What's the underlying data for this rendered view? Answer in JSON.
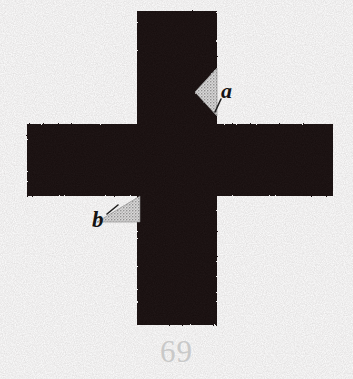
{
  "figure": {
    "number": "69",
    "kind": "cross-dissection-diagram",
    "background_color": "#ffffff",
    "body_color": "#141010",
    "shading_color": "#c6c6c6",
    "label_color": "#141414",
    "number_color": "#c9c9c9",
    "labels": [
      {
        "id": "a",
        "text": "a",
        "points_to": "triangular-notch-upper-right-of-vertical-arm"
      },
      {
        "id": "b",
        "text": "b",
        "points_to": "triangular-piece-below-left-horizontal-arm"
      }
    ],
    "shapes": {
      "cross": {
        "name": "greek-cross",
        "vertical_arm": {
          "left": 137,
          "right": 217,
          "top": 11,
          "bottom": 325
        },
        "horizontal_arm": {
          "left": 27,
          "right": 333,
          "top": 124,
          "bottom": 196
        }
      },
      "triangle_a": {
        "name": "shaded-triangle-a",
        "vertices": [
          [
            217,
            68
          ],
          [
            217,
            116
          ],
          [
            195,
            92
          ]
        ],
        "fill": "stipple-light-gray"
      },
      "triangle_b": {
        "name": "shaded-triangle-b",
        "vertices": [
          [
            97,
            222
          ],
          [
            140,
            196
          ],
          [
            140,
            222
          ]
        ],
        "fill": "stipple-light-gray"
      }
    }
  }
}
